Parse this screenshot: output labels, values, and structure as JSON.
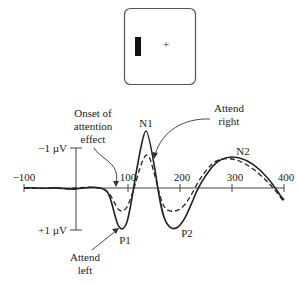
{
  "stimulus": {
    "description": "Display with rectangle bar on left and fixation cross at center",
    "fixation_symbol": "+"
  },
  "labels": {
    "onset_line1": "Onset of",
    "onset_line2": "attention",
    "onset_line3": "effect",
    "attend_right_line1": "Attend",
    "attend_right_line2": "right",
    "attend_left_line1": "Attend",
    "attend_left_line2": "left",
    "n1": "N1",
    "n2": "N2",
    "p1": "P1",
    "p2": "P2",
    "y_top": "−1 µV",
    "y_bottom": "+1 µV"
  },
  "axis": {
    "ticks": [
      "−100",
      "100",
      "200",
      "300",
      "400"
    ]
  },
  "colors": {
    "line": "#222222",
    "axis": "#444444"
  }
}
